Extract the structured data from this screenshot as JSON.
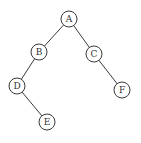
{
  "diagram": {
    "type": "binary-tree",
    "nodes": [
      {
        "id": "A",
        "label": "A",
        "x": 69,
        "y": 19
      },
      {
        "id": "B",
        "label": "B",
        "x": 39,
        "y": 52
      },
      {
        "id": "C",
        "label": "C",
        "x": 94,
        "y": 54
      },
      {
        "id": "D",
        "label": "D",
        "x": 17,
        "y": 86
      },
      {
        "id": "F",
        "label": "F",
        "x": 122,
        "y": 90
      },
      {
        "id": "E",
        "label": "E",
        "x": 47,
        "y": 122
      }
    ],
    "edges": [
      {
        "from": "A",
        "to": "B"
      },
      {
        "from": "A",
        "to": "C"
      },
      {
        "from": "B",
        "to": "D"
      },
      {
        "from": "C",
        "to": "F"
      },
      {
        "from": "D",
        "to": "E"
      }
    ],
    "node_radius": 8,
    "colors": {
      "stroke": "#3a3a3a",
      "fill": "#ffffff",
      "text": "#333333"
    }
  }
}
